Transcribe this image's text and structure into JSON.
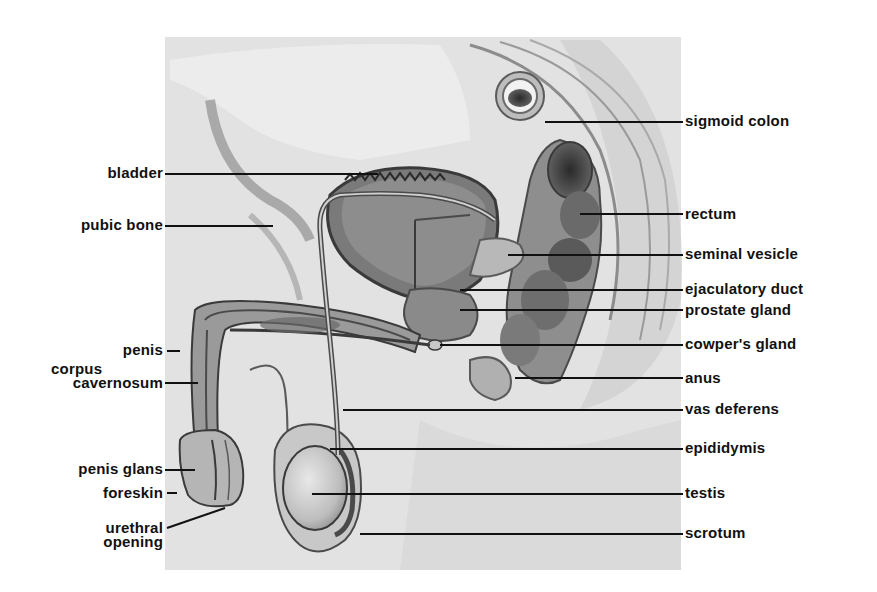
{
  "diagram": {
    "type": "anatomical-illustration",
    "colors": {
      "background": "#ffffff",
      "illustration_bg": "#e4e4e4",
      "tissue_light": "#d0d0d0",
      "tissue_mid": "#9a9a9a",
      "tissue_dark": "#4a4a4a",
      "label_text": "#111111",
      "leader_line": "#111111"
    },
    "labels_left": [
      {
        "id": "bladder",
        "text": "bladder"
      },
      {
        "id": "pubic-bone",
        "text": "pubic bone"
      },
      {
        "id": "penis",
        "text": "penis"
      },
      {
        "id": "corpus-cavernosum",
        "line1": "corpus",
        "line2": "cavernosum"
      },
      {
        "id": "penis-glans",
        "text": "penis glans"
      },
      {
        "id": "foreskin",
        "text": "foreskin"
      },
      {
        "id": "urethral-opening",
        "line1": "urethral",
        "line2": "opening"
      }
    ],
    "labels_right": [
      {
        "id": "sigmoid-colon",
        "text": "sigmoid colon"
      },
      {
        "id": "rectum",
        "text": "rectum"
      },
      {
        "id": "seminal-vesicle",
        "text": "seminal vesicle"
      },
      {
        "id": "ejaculatory-duct",
        "text": "ejaculatory duct"
      },
      {
        "id": "prostate-gland",
        "text": "prostate gland"
      },
      {
        "id": "cowpers-gland",
        "text": "cowper's gland"
      },
      {
        "id": "anus",
        "text": "anus"
      },
      {
        "id": "vas-deferens",
        "text": "vas deferens"
      },
      {
        "id": "epididymis",
        "text": "epididymis"
      },
      {
        "id": "testis",
        "text": "testis"
      },
      {
        "id": "scrotum",
        "text": "scrotum"
      }
    ]
  }
}
